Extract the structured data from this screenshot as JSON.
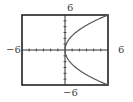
{
  "chart_data": {
    "type": "line",
    "title": "",
    "xlabel": "",
    "ylabel": "",
    "xlim": [
      -6,
      6
    ],
    "ylim": [
      -6,
      6
    ],
    "tick_labels": {
      "x_min": "−6",
      "x_max": "6",
      "y_min": "−6",
      "y_max": "6"
    },
    "grid": false,
    "ticks_step": 1,
    "series": [
      {
        "name": "upper branch",
        "x": [
          0,
          0.5,
          1,
          2,
          3,
          4,
          5,
          6
        ],
        "y": [
          0,
          1.73,
          2.45,
          3.46,
          4.24,
          4.9,
          5.48,
          6
        ]
      },
      {
        "name": "lower branch",
        "x": [
          0,
          0.5,
          1,
          2,
          3,
          4,
          5,
          6
        ],
        "y": [
          0,
          -1.73,
          -2.45,
          -3.46,
          -4.24,
          -4.9,
          -5.48,
          -6
        ]
      }
    ],
    "curve_color": "#555555"
  },
  "labels": {
    "x_min": "−6",
    "x_max": "6",
    "y_min": "−6",
    "y_max": "6"
  }
}
